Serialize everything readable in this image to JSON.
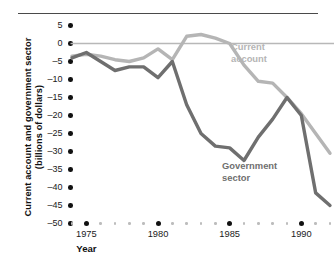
{
  "chart_data": {
    "type": "line",
    "title": "",
    "xlabel": "Year",
    "ylabel": "Current account and government sector (billions of dollars)",
    "ylabel_lines": [
      "Current account and government sector",
      "(billions of dollars)"
    ],
    "xlim": [
      1974,
      1992
    ],
    "ylim": [
      -50,
      5
    ],
    "ytick_step": 5,
    "grid": false,
    "zero_line": true,
    "legend_position": "inline-annotation",
    "yticks": [
      5,
      0,
      -5,
      -10,
      -15,
      -20,
      -25,
      -30,
      -35,
      -40,
      -45,
      -50
    ],
    "ytick_labels": [
      "5",
      "0",
      "–5",
      "–10",
      "–15",
      "–20",
      "–25",
      "–30",
      "–35",
      "–40",
      "–45",
      "–50"
    ],
    "xticks_major": [
      1975,
      1980,
      1985,
      1990
    ],
    "xtick_labels": [
      "1975",
      "1980",
      "1985",
      "1990"
    ],
    "xticks_minor": [
      1974,
      1976,
      1977,
      1978,
      1979,
      1981,
      1982,
      1983,
      1984,
      1986,
      1987,
      1988,
      1989,
      1991,
      1992
    ],
    "x": [
      1974,
      1975,
      1976,
      1977,
      1978,
      1979,
      1980,
      1981,
      1982,
      1983,
      1984,
      1985,
      1986,
      1987,
      1988,
      1989,
      1990,
      1991,
      1992
    ],
    "series": [
      {
        "name": "Current account",
        "color": "#b5b5b5",
        "label_lines": [
          "Current account"
        ],
        "values": [
          -3.5,
          -3.0,
          -3.5,
          -4.5,
          -5.0,
          -4.0,
          -1.5,
          -4.5,
          2.0,
          2.5,
          1.5,
          0.0,
          -6.0,
          -10.5,
          -11.0,
          -15.0,
          -19.5,
          -25.0,
          -30.5
        ]
      },
      {
        "name": "Government sector",
        "color": "#6f6f6f",
        "label_lines": [
          "Government sector"
        ],
        "values": [
          -4.0,
          -2.5,
          -5.0,
          -7.5,
          -6.5,
          -6.5,
          -9.5,
          -5.0,
          -17.0,
          -25.0,
          -28.5,
          -29.0,
          -32.5,
          -26.0,
          -21.0,
          -15.0,
          -20.0,
          -41.5,
          -45.0
        ]
      }
    ],
    "annotations": [
      {
        "name": "current-account-label",
        "text": "Current\naccount",
        "series": "Current account"
      },
      {
        "name": "government-sector-label",
        "text": "Government\nsector",
        "series": "Government sector"
      }
    ]
  }
}
